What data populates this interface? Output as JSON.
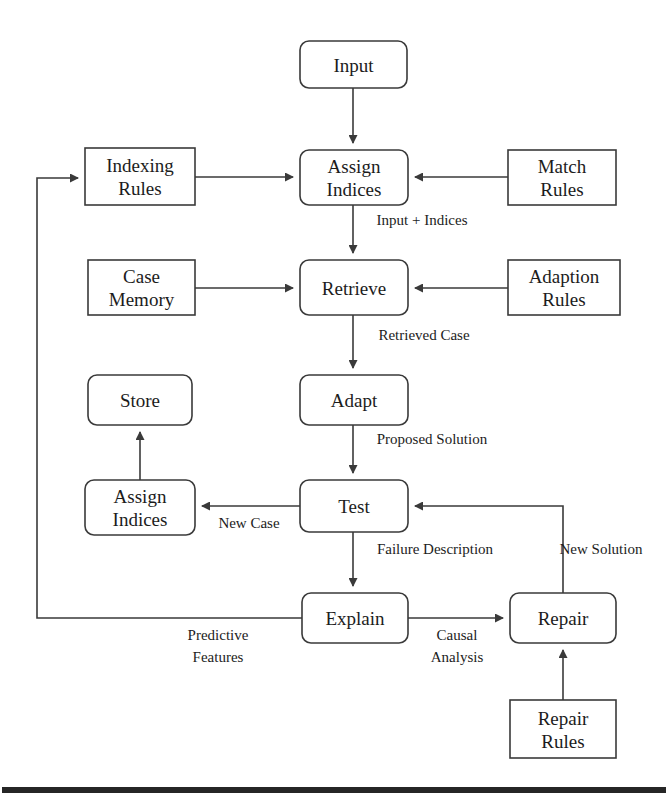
{
  "diagram": {
    "colors": {
      "stroke": "#3a3a3a",
      "text": "#1c1c1c",
      "background": "#ffffff",
      "rule_bar": "#262626"
    },
    "nodes": [
      {
        "id": "input",
        "lines": [
          "Input"
        ],
        "shape": "rounded",
        "x": 300,
        "y": 41,
        "w": 107,
        "h": 47
      },
      {
        "id": "indexing-rules",
        "lines": [
          "Indexing",
          "Rules"
        ],
        "shape": "square",
        "x": 85,
        "y": 148,
        "w": 110,
        "h": 57
      },
      {
        "id": "assign-indices-1",
        "lines": [
          "Assign",
          "Indices"
        ],
        "shape": "rounded",
        "x": 300,
        "y": 150,
        "w": 108,
        "h": 55
      },
      {
        "id": "match-rules",
        "lines": [
          "Match",
          "Rules"
        ],
        "shape": "square",
        "x": 508,
        "y": 150,
        "w": 108,
        "h": 55
      },
      {
        "id": "case-memory",
        "lines": [
          "Case",
          "Memory"
        ],
        "shape": "square",
        "x": 88,
        "y": 260,
        "w": 107,
        "h": 55
      },
      {
        "id": "retrieve",
        "lines": [
          "Retrieve"
        ],
        "shape": "rounded",
        "x": 300,
        "y": 260,
        "w": 108,
        "h": 55
      },
      {
        "id": "adaption-rules",
        "lines": [
          "Adaption",
          "Rules"
        ],
        "shape": "square",
        "x": 508,
        "y": 260,
        "w": 112,
        "h": 55
      },
      {
        "id": "store",
        "lines": [
          "Store"
        ],
        "shape": "rounded",
        "x": 88,
        "y": 375,
        "w": 104,
        "h": 50
      },
      {
        "id": "adapt",
        "lines": [
          "Adapt"
        ],
        "shape": "rounded",
        "x": 300,
        "y": 375,
        "w": 108,
        "h": 50
      },
      {
        "id": "assign-indices-2",
        "lines": [
          "Assign",
          "Indices"
        ],
        "shape": "rounded",
        "x": 85,
        "y": 480,
        "w": 110,
        "h": 55
      },
      {
        "id": "test",
        "lines": [
          "Test"
        ],
        "shape": "rounded",
        "x": 300,
        "y": 480,
        "w": 108,
        "h": 52
      },
      {
        "id": "explain",
        "lines": [
          "Explain"
        ],
        "shape": "rounded",
        "x": 302,
        "y": 593,
        "w": 106,
        "h": 50
      },
      {
        "id": "repair",
        "lines": [
          "Repair"
        ],
        "shape": "rounded",
        "x": 510,
        "y": 593,
        "w": 106,
        "h": 50
      },
      {
        "id": "repair-rules",
        "lines": [
          "Repair",
          "Rules"
        ],
        "shape": "square",
        "x": 510,
        "y": 700,
        "w": 106,
        "h": 58
      }
    ],
    "edges": [
      {
        "id": "input-to-assign",
        "path": "M 353,88 L 353,143",
        "arrow": "down"
      },
      {
        "id": "indexing-to-assign",
        "path": "M 195,177 L 293,177",
        "arrow": "right"
      },
      {
        "id": "match-to-assign",
        "path": "M 508,177 L 415,177",
        "arrow": "left"
      },
      {
        "id": "assign-to-retrieve",
        "path": "M 353,205 L 353,253",
        "arrow": "down"
      },
      {
        "id": "memory-to-retrieve",
        "path": "M 195,288 L 293,288",
        "arrow": "right"
      },
      {
        "id": "adaption-to-retrieve",
        "path": "M 508,288 L 415,288",
        "arrow": "left"
      },
      {
        "id": "retrieve-to-adapt",
        "path": "M 353,315 L 353,368",
        "arrow": "down"
      },
      {
        "id": "adapt-to-test",
        "path": "M 353,425 L 353,473",
        "arrow": "down"
      },
      {
        "id": "test-to-assign2",
        "path": "M 300,506 L 202,506",
        "arrow": "left"
      },
      {
        "id": "assign2-to-store",
        "path": "M 140,480 L 140,432",
        "arrow": "up"
      },
      {
        "id": "test-to-explain",
        "path": "M 353,532 L 353,586",
        "arrow": "down"
      },
      {
        "id": "explain-to-repair",
        "path": "M 408,618 L 503,618",
        "arrow": "right"
      },
      {
        "id": "repair-rules-to-repair",
        "path": "M 563,700 L 563,650",
        "arrow": "up"
      },
      {
        "id": "repair-to-test",
        "path": "M 563,593 L 563,506 L 415,506",
        "arrow": "left"
      },
      {
        "id": "explain-to-indexing",
        "path": "M 302,618 L 37,618 L 37,178 L 78,178",
        "arrow": "right"
      }
    ],
    "edge_labels": [
      {
        "id": "input-plus-indices",
        "lines": [
          "Input + Indices"
        ],
        "x": 422,
        "y": 225
      },
      {
        "id": "retrieved-case",
        "lines": [
          "Retrieved Case"
        ],
        "x": 424,
        "y": 340
      },
      {
        "id": "proposed-solution",
        "lines": [
          "Proposed Solution"
        ],
        "x": 432,
        "y": 444
      },
      {
        "id": "new-case",
        "lines": [
          "New Case"
        ],
        "x": 249,
        "y": 528
      },
      {
        "id": "failure-description",
        "lines": [
          "Failure Description"
        ],
        "x": 435,
        "y": 554
      },
      {
        "id": "new-solution",
        "lines": [
          "New Solution"
        ],
        "x": 601,
        "y": 554,
        "stacked": true
      },
      {
        "id": "predictive-features",
        "lines": [
          "Predictive",
          "Features"
        ],
        "x": 218,
        "y": 640
      },
      {
        "id": "causal-analysis",
        "lines": [
          "Causal",
          "Analysis"
        ],
        "x": 457,
        "y": 640
      }
    ],
    "footer_rule": {
      "id": "bottom-rule",
      "x": 2,
      "y": 787,
      "w": 664,
      "h": 6
    }
  }
}
